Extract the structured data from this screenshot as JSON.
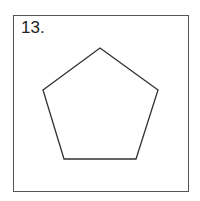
{
  "problem": {
    "number_label": "13.",
    "shape": "pentagon",
    "vertices": [
      [
        100,
        48
      ],
      [
        158,
        90
      ],
      [
        136,
        159
      ],
      [
        64,
        159
      ],
      [
        43,
        90
      ]
    ],
    "stroke_color": "#333333",
    "frame_color": "#555555"
  }
}
